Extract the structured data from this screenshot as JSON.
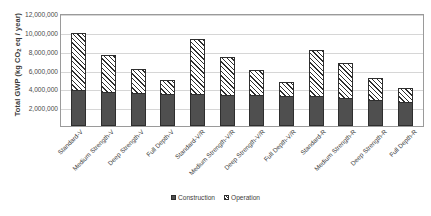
{
  "chart_data": {
    "type": "bar",
    "stacked": true,
    "title": "",
    "xlabel": "",
    "ylabel": "Total GWP (kg CO2 eq / year)",
    "ylabel_parts": {
      "pre": "Total GWP (kg CO",
      "sub": "2",
      "post": " eq / year)"
    },
    "ylim": [
      0,
      12000000
    ],
    "ytick_values": [
      0,
      2000000,
      4000000,
      6000000,
      8000000,
      10000000,
      12000000
    ],
    "ytick_labels": [
      "",
      "2,000,000",
      "4,000,000",
      "6,000,000",
      "8,000,000",
      "10,000,000",
      "12,000,000"
    ],
    "grid": true,
    "grid_axis": "y",
    "legend_position": "bottom-center",
    "categories": [
      "Standard-V",
      "Medium Strength-V",
      "Deep Strength-V",
      "Full Depth-V",
      "Standard-V/R",
      "Medium Strength-V/R",
      "Deep Strength-V/R",
      "Full Depth-V/R",
      "Standard-R",
      "Medium Strength-R",
      "Deep Strength-R",
      "Full Depth-R"
    ],
    "series": [
      {
        "name": "Construction",
        "fill": "solid",
        "color": "#4f4f4f",
        "values": [
          3800000,
          3600000,
          3500000,
          3400000,
          3400000,
          3300000,
          3250000,
          3200000,
          3200000,
          2950000,
          2750000,
          2500000
        ]
      },
      {
        "name": "Operation",
        "fill": "hatched",
        "color": "#ffffff",
        "values": [
          6100000,
          3900000,
          2600000,
          1500000,
          5800000,
          4000000,
          2650000,
          1500000,
          4900000,
          3700000,
          2350000,
          1500000
        ]
      }
    ],
    "totals": [
      9900000,
      7500000,
      6100000,
      4900000,
      9200000,
      7300000,
      5900000,
      4700000,
      8100000,
      6650000,
      5100000,
      4000000
    ]
  }
}
